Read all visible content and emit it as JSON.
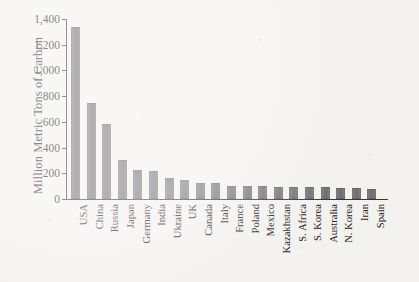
{
  "chart_data": {
    "type": "bar",
    "title": "",
    "xlabel": "",
    "ylabel": "Million Metric Tons of Carbon",
    "ylim": [
      0,
      1400
    ],
    "ytick_values": [
      0,
      200,
      400,
      600,
      800,
      1000,
      1200,
      1400
    ],
    "ytick_labels": [
      "0",
      "200",
      "400",
      "600",
      "800",
      "1,000",
      "1,200",
      "1,400"
    ],
    "grid": false,
    "legend": "none",
    "bar_color": "#76767a",
    "background_color": "#f4f2ef",
    "axis_color": "#3b3834",
    "categories": [
      "USA",
      "China",
      "Russia",
      "Japan",
      "Germany",
      "India",
      "Ukraine",
      "UK",
      "Canada",
      "Italy",
      "France",
      "Poland",
      "Mexico",
      "Kazakhstan",
      "S. Africa",
      "S. Korea",
      "Australia",
      "N. Korea",
      "Iran",
      "Spain"
    ],
    "values": [
      1335,
      745,
      580,
      305,
      228,
      215,
      165,
      150,
      128,
      125,
      105,
      100,
      98,
      96,
      94,
      92,
      90,
      85,
      82,
      78
    ]
  }
}
